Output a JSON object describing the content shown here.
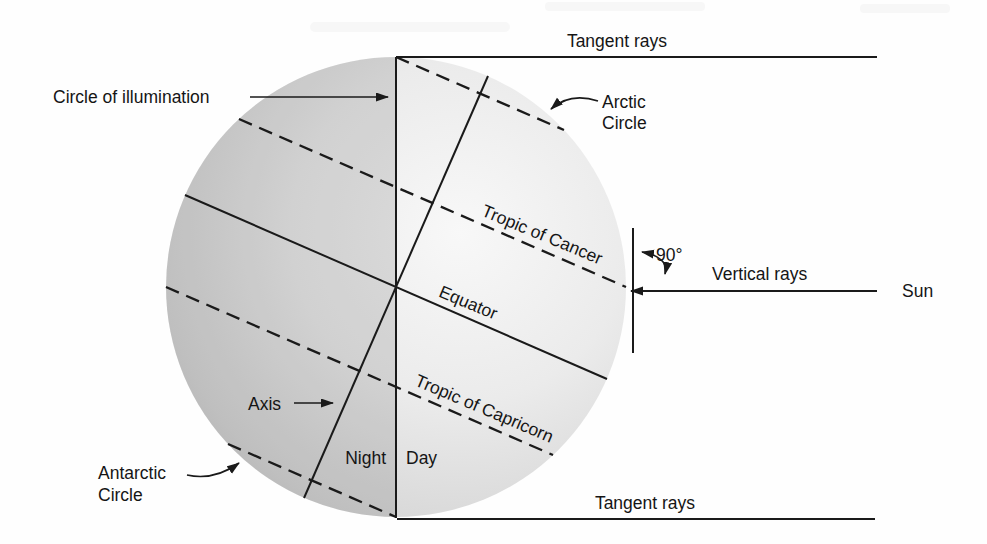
{
  "diagram": {
    "title_semantic": "Circle of illumination diagram (June solstice)",
    "labels": {
      "tangent_rays_top": "Tangent rays",
      "tangent_rays_bottom": "Tangent rays",
      "circle_of_illumination": "Circle of illumination",
      "arctic_circle_line1": "Arctic",
      "arctic_circle_line2": "Circle",
      "tropic_of_cancer": "Tropic of Cancer",
      "equator": "Equator",
      "tropic_of_capricorn": "Tropic of Capricorn",
      "axis": "Axis",
      "night": "Night",
      "day": "Day",
      "angle_90": "90°",
      "vertical_rays": "Vertical rays",
      "sun": "Sun",
      "antarctic_circle_line1": "Antarctic",
      "antarctic_circle_line2": "Circle"
    },
    "colors": {
      "line": "#1a1a1a",
      "text": "#151515",
      "background": "#fefefe",
      "globe_highlight": "#f7f7f7",
      "globe_rim": "#bdbdbd",
      "night_shade": "rgba(0,0,0,0.11)"
    }
  }
}
